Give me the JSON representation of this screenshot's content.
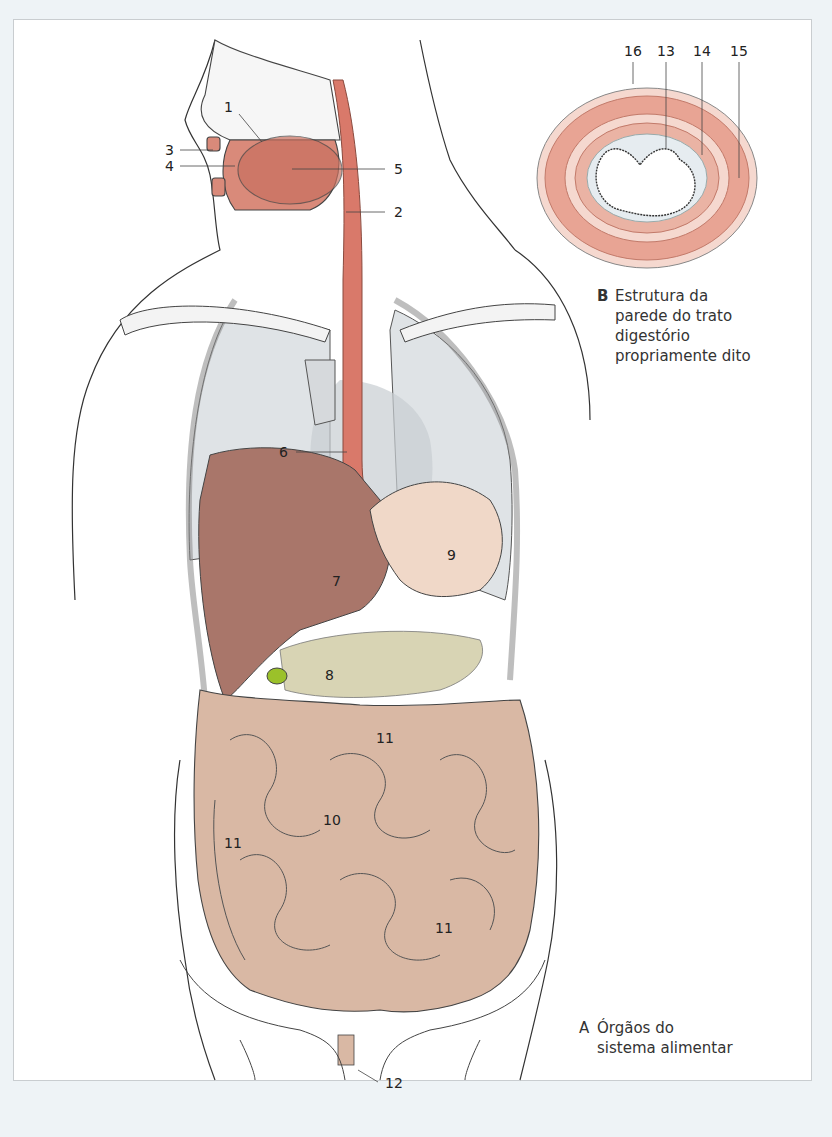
{
  "figure": {
    "panel_a": {
      "letter": "A",
      "caption_line1": "Órgãos do",
      "caption_line2": "sistema alimentar"
    },
    "panel_b": {
      "letter": "B",
      "caption_line1": "Estrutura da",
      "caption_line2": "parede do trato",
      "caption_line3": "digestório",
      "caption_line4": "propriamente dito"
    },
    "labels_a": [
      {
        "id": "1",
        "text": "1"
      },
      {
        "id": "2",
        "text": "2"
      },
      {
        "id": "3",
        "text": "3"
      },
      {
        "id": "4",
        "text": "4"
      },
      {
        "id": "5",
        "text": "5"
      },
      {
        "id": "6",
        "text": "6"
      },
      {
        "id": "7",
        "text": "7"
      },
      {
        "id": "8",
        "text": "8"
      },
      {
        "id": "9",
        "text": "9"
      },
      {
        "id": "10",
        "text": "10"
      },
      {
        "id": "11a",
        "text": "11"
      },
      {
        "id": "11b",
        "text": "11"
      },
      {
        "id": "11c",
        "text": "11"
      },
      {
        "id": "12",
        "text": "12"
      }
    ],
    "labels_b": [
      {
        "id": "16",
        "text": "16"
      },
      {
        "id": "13",
        "text": "13"
      },
      {
        "id": "14",
        "text": "14"
      },
      {
        "id": "15",
        "text": "15"
      }
    ],
    "colors": {
      "muscle": "#d98a7a",
      "esophagus": "#d9796a",
      "liver": "#a9766a",
      "stomach": "#f0d8c8",
      "intestine": "#d9b8a4",
      "lung": "#dfe3e6",
      "gallbladder": "#9bc12a",
      "pancreas": "#d8d4b4",
      "outline": "#333333",
      "background": "#eef3f6"
    }
  }
}
